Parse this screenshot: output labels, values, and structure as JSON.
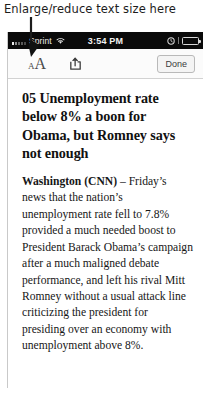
{
  "annotation": {
    "text": "Enlarge/reduce text size here",
    "arrow": "down-arrow-icon"
  },
  "status_bar": {
    "carrier": "Sprint",
    "signal_icon": "signal-bars-icon",
    "wifi_icon": "wifi-icon",
    "time": "3:54 PM",
    "alarm_icon": "alarm-clock-icon",
    "battery_icon": "battery-icon"
  },
  "toolbar": {
    "text_size": {
      "icon": "text-size-icon",
      "small_a": "A",
      "large_a": "A"
    },
    "share": {
      "icon": "share-icon"
    },
    "done_label": "Done"
  },
  "article": {
    "headline": "05 Unemployment rate below 8% a boon for Obama, but Romney says not enough",
    "lede_source": "Washington (CNN)",
    "body": " – Friday’s news that the nation’s unemployment rate fell to 7.8% provided a much needed boost to President Barack Obama’s campaign after a much maligned debate performance, and left his rival Mitt Romney without a usual attack line criticizing the president for presiding over an economy with unemployment above 8%."
  },
  "colors": {
    "status_bar_bg": "#0a0a0a",
    "toolbar_bg": "#fbfbfb",
    "page_bg": "#ffffff",
    "text": "#161616"
  }
}
